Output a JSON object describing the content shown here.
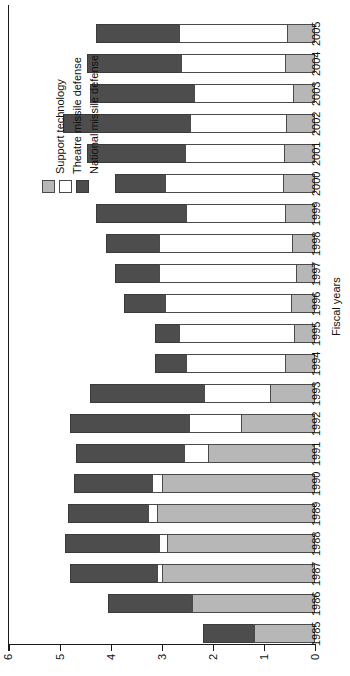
{
  "chart_data": {
    "type": "bar",
    "subtype": "stacked-horizontal-rotated",
    "title": "",
    "xlabel": "Fiscal years",
    "ylabel": "",
    "ylim": [
      0,
      6
    ],
    "yticks": [
      0,
      1,
      2,
      3,
      4,
      5,
      6
    ],
    "ytick_labels": [
      "0",
      "1",
      "2",
      "3",
      "4",
      "5",
      "6"
    ],
    "grid": false,
    "legend_position": "left-middle",
    "categories": [
      "1985",
      "1986",
      "1987",
      "1988",
      "1989",
      "1990",
      "1991",
      "1992",
      "1993",
      "1994",
      "1995",
      "1996",
      "1997",
      "1998",
      "1999",
      "2000",
      "2001",
      "2002",
      "2003",
      "2004",
      "2005"
    ],
    "series": [
      {
        "name": "Support technology",
        "color": "#b7b7b7",
        "values": [
          1.2,
          2.4,
          3.0,
          2.9,
          3.1,
          3.0,
          2.1,
          1.45,
          0.88,
          0.59,
          0.41,
          0.47,
          0.37,
          0.45,
          0.59,
          0.63,
          0.6,
          0.57,
          0.43,
          0.59,
          0.55
        ]
      },
      {
        "name": "Theatre missile defense",
        "color": "#ffffff",
        "values": [
          0.0,
          0.0,
          0.12,
          0.18,
          0.18,
          0.2,
          0.49,
          1.04,
          1.31,
          1.96,
          2.27,
          2.49,
          2.71,
          2.63,
          1.96,
          2.33,
          1.96,
          1.9,
          1.96,
          2.06,
          2.14
        ]
      },
      {
        "name": "National missile defense",
        "color": "#4d4d4d",
        "values": [
          1.0,
          1.65,
          1.72,
          1.85,
          1.6,
          1.56,
          2.12,
          2.35,
          2.25,
          0.63,
          0.49,
          0.82,
          0.88,
          1.04,
          1.78,
          1.0,
          1.94,
          2.51,
          2.06,
          1.86,
          1.63
        ]
      }
    ],
    "totals": [
      2.2,
      4.05,
      4.84,
      4.93,
      4.88,
      4.76,
      4.71,
      4.84,
      4.44,
      3.18,
      3.17,
      3.78,
      3.96,
      4.12,
      4.33,
      3.96,
      4.5,
      4.98,
      4.45,
      4.51,
      4.32
    ]
  },
  "legend": {
    "entries": [
      {
        "label": "Support technology",
        "swatch": "#b7b7b7"
      },
      {
        "label": "Theatre missile defense",
        "swatch": "#ffffff"
      },
      {
        "label": "National missile defense",
        "swatch": "#4d4d4d"
      }
    ]
  },
  "axes": {
    "category_axis_title": "Fiscal years"
  }
}
